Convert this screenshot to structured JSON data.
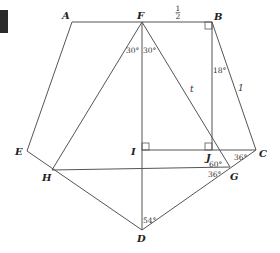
{
  "diagram": {
    "colors": {
      "line": "#555555",
      "text": "#222222",
      "corner_block": "#2b2b2b"
    },
    "points": [
      {
        "id": "A",
        "x": 72,
        "y": 22,
        "label": "A",
        "lx": 62,
        "ly": 19
      },
      {
        "id": "F",
        "x": 142,
        "y": 22,
        "label": "F",
        "lx": 137,
        "ly": 19
      },
      {
        "id": "B",
        "x": 212,
        "y": 22,
        "label": "B",
        "lx": 214,
        "ly": 20
      },
      {
        "id": "C",
        "x": 256,
        "y": 150,
        "label": "C",
        "lx": 259,
        "ly": 157
      },
      {
        "id": "G",
        "x": 230,
        "y": 167,
        "label": "G",
        "lx": 230,
        "ly": 180
      },
      {
        "id": "D",
        "x": 142,
        "y": 230,
        "label": "D",
        "lx": 137,
        "ly": 242
      },
      {
        "id": "H",
        "x": 52,
        "y": 170,
        "label": "H",
        "lx": 42,
        "ly": 181
      },
      {
        "id": "E",
        "x": 27,
        "y": 151,
        "label": "E",
        "lx": 15,
        "ly": 155
      },
      {
        "id": "I",
        "x": 142,
        "y": 150,
        "label": "I",
        "lx": 131,
        "ly": 155
      },
      {
        "id": "J",
        "x": 212,
        "y": 150,
        "label": "J",
        "lx": 206,
        "ly": 161
      }
    ],
    "segments": [
      [
        "A",
        "B"
      ],
      [
        "A",
        "E"
      ],
      [
        "E",
        "D"
      ],
      [
        "D",
        "C"
      ],
      [
        "C",
        "B"
      ],
      [
        "B",
        "J"
      ],
      [
        "I",
        "C"
      ],
      [
        "F",
        "D"
      ],
      [
        "F",
        "H"
      ],
      [
        "F",
        "G"
      ],
      [
        "H",
        "G"
      ]
    ],
    "right_angles": [
      {
        "at": "B",
        "x": 205,
        "y": 22,
        "w": 7,
        "h": 7
      },
      {
        "at": "I",
        "x": 142,
        "y": 143,
        "w": 7,
        "h": 7
      },
      {
        "at": "J",
        "x": 205,
        "y": 143,
        "w": 7,
        "h": 7
      }
    ],
    "angle_labels": [
      {
        "text": "30°",
        "x": 126,
        "y": 53
      },
      {
        "text": "30°",
        "x": 143,
        "y": 53
      },
      {
        "text": "18°",
        "x": 213,
        "y": 73
      },
      {
        "text": "60°",
        "x": 209,
        "y": 167
      },
      {
        "text": "36°",
        "x": 208,
        "y": 177
      },
      {
        "text": "36°",
        "x": 234,
        "y": 160
      },
      {
        "text": "54°",
        "x": 143,
        "y": 223
      }
    ],
    "length_labels": [
      {
        "text": "1/2",
        "num": "1",
        "den": "2",
        "x": 178,
        "y": 13
      },
      {
        "text": "t",
        "x": 190,
        "y": 92
      },
      {
        "text": "1",
        "x": 238,
        "y": 91
      }
    ],
    "corner_block": {
      "x": 0,
      "y": 10,
      "w": 8,
      "h": 23
    }
  }
}
